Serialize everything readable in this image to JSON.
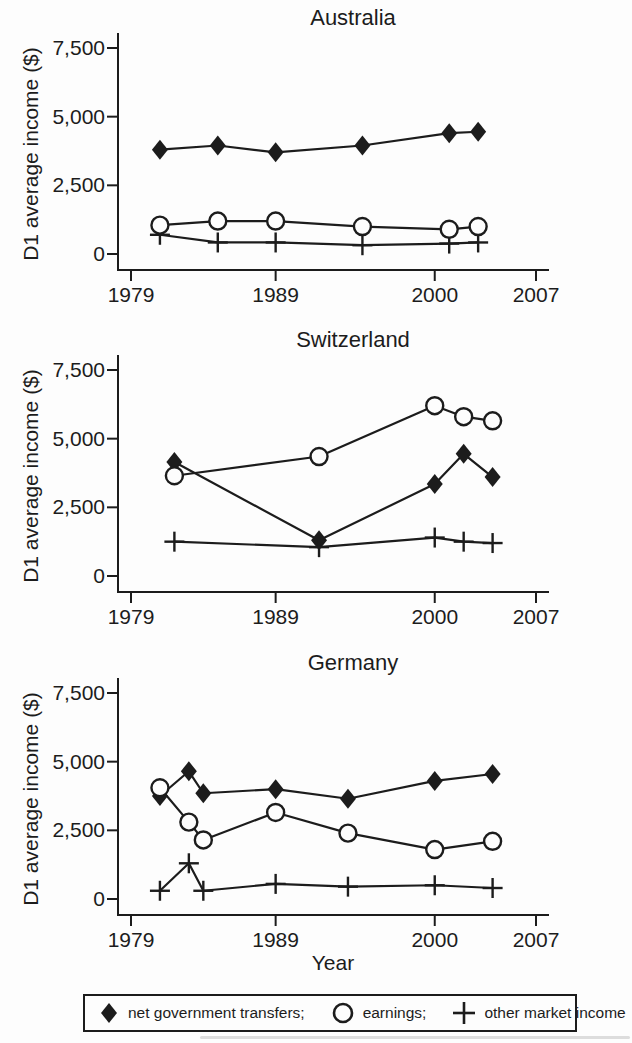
{
  "figure": {
    "ylabel": "D1 average income ($)",
    "xlabel": "Year",
    "ink_color": "#1c1c1c",
    "background": "#fdfdfd"
  },
  "axis": {
    "yticks": [
      0,
      2500,
      5000,
      7500
    ],
    "ytick_labels": [
      "0",
      "2,500",
      "5,000",
      "7,500"
    ],
    "xticks": [
      1979,
      1989,
      2000,
      2007
    ],
    "xtick_labels": [
      "1979",
      "1989",
      "2000",
      "2007"
    ],
    "ylim": [
      0,
      7500
    ],
    "xlim": [
      1979,
      2007
    ],
    "grid": "off"
  },
  "legend": {
    "position": "bottom",
    "items": [
      {
        "marker": "diamond-filled",
        "label": "net government transfers;"
      },
      {
        "marker": "circle-open",
        "label": "earnings;"
      },
      {
        "marker": "plus",
        "label": "other market income"
      }
    ]
  },
  "chart_data": [
    {
      "type": "line",
      "title": "Australia",
      "ylabel": "D1 average income ($)",
      "xlabel": "",
      "ylim": [
        0,
        7500
      ],
      "xlim": [
        1979,
        2007
      ],
      "x": [
        1981,
        1985,
        1989,
        1995,
        2001,
        2003
      ],
      "series": [
        {
          "name": "net government transfers",
          "marker": "diamond",
          "values": [
            3800,
            3950,
            3700,
            3950,
            4400,
            4450
          ]
        },
        {
          "name": "earnings",
          "marker": "circle",
          "values": [
            1050,
            1200,
            1200,
            1000,
            900,
            1000
          ]
        },
        {
          "name": "other market income",
          "marker": "plus",
          "values": [
            700,
            420,
            420,
            320,
            380,
            420
          ]
        }
      ]
    },
    {
      "type": "line",
      "title": "Switzerland",
      "ylabel": "D1 average income ($)",
      "xlabel": "",
      "ylim": [
        0,
        7500
      ],
      "xlim": [
        1979,
        2007
      ],
      "x": [
        1982,
        1992,
        2000,
        2002,
        2004
      ],
      "series": [
        {
          "name": "net government transfers",
          "marker": "diamond",
          "values": [
            4150,
            1300,
            3350,
            4450,
            3600
          ]
        },
        {
          "name": "earnings",
          "marker": "circle",
          "values": [
            3650,
            4350,
            6200,
            5800,
            5650
          ]
        },
        {
          "name": "other market income",
          "marker": "plus",
          "values": [
            1250,
            1050,
            1400,
            1250,
            1200
          ]
        }
      ]
    },
    {
      "type": "line",
      "title": "Germany",
      "ylabel": "D1 average income ($)",
      "xlabel": "Year",
      "ylim": [
        0,
        7500
      ],
      "xlim": [
        1979,
        2007
      ],
      "x": [
        1981,
        1983,
        1984,
        1989,
        1994,
        2000,
        2004
      ],
      "series": [
        {
          "name": "net government transfers",
          "marker": "diamond",
          "values": [
            3750,
            4650,
            3850,
            4000,
            3650,
            4300,
            4550
          ]
        },
        {
          "name": "earnings",
          "marker": "circle",
          "values": [
            4050,
            2800,
            2150,
            3150,
            2400,
            1800,
            2100
          ]
        },
        {
          "name": "other market income",
          "marker": "plus",
          "values": [
            300,
            1300,
            300,
            550,
            450,
            500,
            400
          ]
        }
      ]
    }
  ]
}
